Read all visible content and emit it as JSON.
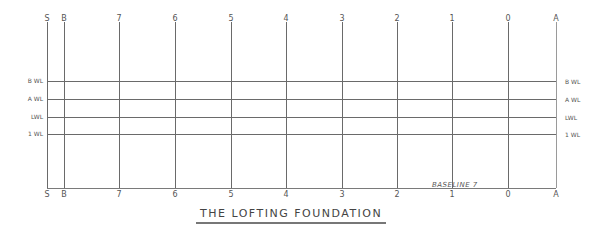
{
  "title": "THE LOFTING FOUNDATION",
  "baseline_label": "BASELINE 7",
  "stations": [
    {
      "label": "S",
      "bottom_label": "S",
      "x": 47
    },
    {
      "label": "B",
      "bottom_label": "B",
      "x": 64
    },
    {
      "label": "7",
      "bottom_label": "7",
      "x": 119
    },
    {
      "label": "6",
      "bottom_label": "6",
      "x": 175
    },
    {
      "label": "5",
      "bottom_label": "5",
      "x": 231
    },
    {
      "label": "4",
      "bottom_label": "4",
      "x": 286
    },
    {
      "label": "3",
      "bottom_label": "3",
      "x": 342
    },
    {
      "label": "2",
      "bottom_label": "2",
      "x": 397
    },
    {
      "label": "1",
      "bottom_label": "1",
      "x": 452
    },
    {
      "label": "0",
      "bottom_label": "0",
      "x": 508
    },
    {
      "label": "A",
      "bottom_label": "A",
      "x": 556
    }
  ],
  "waterlines": [
    {
      "left_label": "B WL",
      "right_label": "B WL",
      "y": 81
    },
    {
      "left_label": "A WL",
      "right_label": "A WL",
      "y": 99
    },
    {
      "left_label": "LWL",
      "right_label": "LWL",
      "y": 117
    },
    {
      "left_label": "1 WL",
      "right_label": "1 WL",
      "y": 134
    }
  ]
}
